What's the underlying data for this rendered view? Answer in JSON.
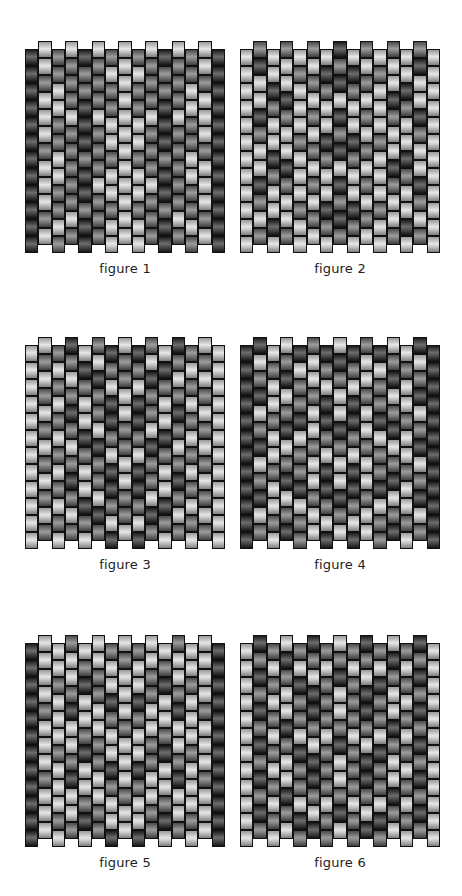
{
  "figures": [
    {
      "label": "figure 1",
      "x": 25,
      "y": 41,
      "columns": [
        "DDDDDDDDDDDD",
        "LLMLLLMLLLML",
        "MMLLMMLLMMLM",
        "LMMMLMMMMMLM",
        "DMMDDDMDDMDD",
        "LMMMLMMMLMMM",
        "MLMMLLMLLMLL",
        "LLLLLLLLLLLL",
        "MLMMLLMLLMLL",
        "LMMMLMMMLMMM",
        "DMMDDDMDDMDD",
        "LMMMLMMMMMLM",
        "MMLLMMLLMMLM",
        "LLMLLLMLLLML",
        "DDDDDDDDDDDD"
      ]
    },
    {
      "label": "figure 2",
      "x": 240,
      "y": 41,
      "columns": [
        "LLLLLLLLLLLL",
        "MDLLDMLLDMLM",
        "LLDMLLDMLLDL",
        "MLLDMLLDMLLM",
        "LMLLLMLLLMLL",
        "MLMLMLMLMLML",
        "LDMLLDMLLDML",
        "DMDLDMDLDMDM",
        "LDMLLDMLLDML",
        "MLMLMLMLMLML",
        "LMLLLMLLLMLL",
        "MLLDMLLDMLLM",
        "LLDMLLDMLLDL",
        "MDLLDMLLDMLM",
        "LLLLLLLLLLLL"
      ]
    },
    {
      "label": "figure 3",
      "x": 25,
      "y": 337,
      "columns": [
        "LLLLLLLLLLLL",
        "LMLMLMLMLMLM",
        "MLMLMLMLMLML",
        "DMLMDMLMDMLM",
        "LDMLLDMLLDML",
        "MLDMMLDMMLDM",
        "DMLDDMLDDMLD",
        "LMMLLMMLLMML",
        "DMLDDMLDDMLD",
        "MLDMMLDMMLDM",
        "LDMLLDMLLDML",
        "DMLMDMLMDMLM",
        "MLMLMLMLMLML",
        "LMLMLMLMLMLM",
        "LLLLLLLLLLLL"
      ]
    },
    {
      "label": "figure 4",
      "x": 240,
      "y": 337,
      "columns": [
        "DDDDDDDDDDDD",
        "DLMDLMDLMDLM",
        "LMLLMLLMLLML",
        "LMDLMDLMDLMD",
        "DLMMDLMMDLMM",
        "MLLMLLMLLMLL",
        "DMLDDMLDDMLD",
        "LDMLLDMLLDML",
        "DMLDDMLDDMLD",
        "MLLMLLMLLMLL",
        "DLMMDLMMDLMM",
        "LMDLMDLMDLMD",
        "LMLLMLLMLLML",
        "DLMDLMDLMDLM",
        "DDDDDDDDDDDD"
      ]
    },
    {
      "label": "figure 5",
      "x": 25,
      "y": 635,
      "columns": [
        "DDDDDDDDDDDD",
        "LLLLMLLLMLLL",
        "LLMLLLMLLLML",
        "MLLMDLLMDLLM",
        "LMDLLMDLLMDL",
        "LLMMLLMMLLMM",
        "MLLDMLLDMLLD",
        "LMLLLMLLLMLL",
        "MLLDMLLDMLLD",
        "LLMMLLMMLLMM",
        "LMDLLMDLLMDL",
        "MLLMDLLMDLLM",
        "LLMLLLMLLLML",
        "LLLLMLLLMLLL",
        "DDDDDDDDDDDD"
      ]
    },
    {
      "label": "figure 6",
      "x": 240,
      "y": 635,
      "columns": [
        "LLLLLLLLLLLL",
        "DMDMDMDMDMDM",
        "MLMLMLMLMLML",
        "LDMLLDMLLDML",
        "MLDMMLDMMLDM",
        "DMLDDMLDDMLD",
        "MLMMMLMMMLMM",
        "LMDLLMDLLMDL",
        "MLMMMLMMMLMM",
        "DMLDDMLDDMLD",
        "MLDMMLDMMLDM",
        "LDMLLDMLLDML",
        "MLMLMLMLMLML",
        "DMDMDMDMDMDM",
        "LLLLLLLLLLLL"
      ]
    }
  ],
  "legend": {
    "L": "light bead",
    "M": "medium bead",
    "D": "dark bead"
  }
}
